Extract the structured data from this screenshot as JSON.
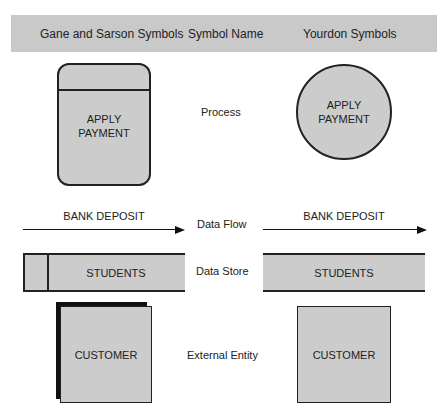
{
  "header": {
    "col_gane_sarson": "Gane and Sarson Symbols",
    "col_symbol_name": "Symbol Name",
    "col_yourdon": "Yourdon Symbols"
  },
  "rows": {
    "process": {
      "name": "Process",
      "gane_sarson_label_line1": "APPLY",
      "gane_sarson_label_line2": "PAYMENT",
      "yourdon_label_line1": "APPLY",
      "yourdon_label_line2": "PAYMENT"
    },
    "data_flow": {
      "name": "Data Flow",
      "gane_sarson_label": "BANK DEPOSIT",
      "yourdon_label": "BANK DEPOSIT"
    },
    "data_store": {
      "name": "Data Store",
      "gane_sarson_label": "STUDENTS",
      "yourdon_label": "STUDENTS"
    },
    "external_entity": {
      "name": "External Entity",
      "gane_sarson_label": "CUSTOMER",
      "yourdon_label": "CUSTOMER"
    }
  },
  "colors": {
    "header_band": "#c9c9c9",
    "shape_fill": "#cccccc",
    "stroke": "#222222"
  }
}
